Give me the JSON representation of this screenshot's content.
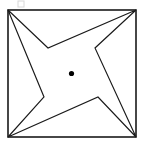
{
  "figure": {
    "title": "Four-pointed star inscribed in a square",
    "description": "A square outline containing a concave four-pointed star (pinwheel / shuriken shape) whose four points touch the square's corners, with a small filled dot marking the center.",
    "canvas": {
      "width": 144,
      "height": 146,
      "background": "#ffffff"
    },
    "colors": {
      "stroke": "#1a1a1a",
      "star_stroke": "#1a1a1a",
      "fill": "#ffffff",
      "dot": "#000000",
      "artifact": "#d8d8d8"
    },
    "square": {
      "label": "square frame",
      "x": 8,
      "y": 10,
      "width": 128,
      "height": 127,
      "stroke_width": 1.6,
      "corners": [
        {
          "name": "top-left",
          "x": 8,
          "y": 10
        },
        {
          "name": "top-right",
          "x": 136,
          "y": 10
        },
        {
          "name": "bottom-right",
          "x": 136,
          "y": 137
        },
        {
          "name": "bottom-left",
          "x": 8,
          "y": 137
        }
      ]
    },
    "star": {
      "label": "four-pointed star",
      "point_count": 4,
      "stroke_width": 1.15,
      "points": [
        {
          "name": "tip-top-left",
          "type": "tip",
          "x": 8,
          "y": 10
        },
        {
          "name": "notch-top",
          "type": "notch",
          "x": 48,
          "y": 48
        },
        {
          "name": "tip-top-right",
          "type": "tip",
          "x": 136,
          "y": 10
        },
        {
          "name": "notch-right",
          "type": "notch",
          "x": 95,
          "y": 48
        },
        {
          "name": "tip-bottom-right",
          "type": "tip",
          "x": 136,
          "y": 137
        },
        {
          "name": "notch-bottom",
          "type": "notch",
          "x": 98,
          "y": 97
        },
        {
          "name": "tip-bottom-left",
          "type": "tip",
          "x": 8,
          "y": 137
        },
        {
          "name": "notch-left",
          "type": "notch",
          "x": 44,
          "y": 97
        }
      ],
      "path": "M 8 10 L 48 48 L 136 10 L 95 48 L 136 137 L 98 97 L 8 137 L 44 97 Z"
    },
    "center_dot": {
      "label": "center point",
      "cx": 71.5,
      "cy": 73.5,
      "r": 2.6
    },
    "artifact": {
      "label": "faint scan mark",
      "x": 18,
      "y": 1,
      "width": 6,
      "height": 6
    }
  }
}
